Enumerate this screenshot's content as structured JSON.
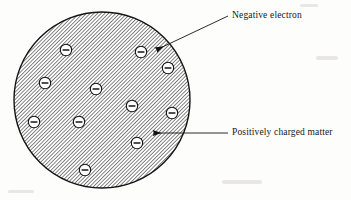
{
  "diagram": {
    "background_color": "#fdfdfc",
    "sphere": {
      "name": "positively-charged-matter-sphere",
      "center_x": 102,
      "center_y": 100,
      "radius": 88,
      "fill_pattern": "diagonal-hatch",
      "hatch_angle_deg": 45,
      "hatch_color": "#3a3a3a",
      "hatch_spacing_px": 2,
      "outline_color": "#1a1a1a",
      "outline_width": 1.4
    },
    "electrons": {
      "symbol": "−",
      "count": 11,
      "radius": 5.6,
      "fill_color": "#ffffff",
      "outline_color": "#141414",
      "sign_color": "#141414",
      "positions": [
        {
          "id": "electron-1",
          "x": 66,
          "y": 50
        },
        {
          "id": "electron-2",
          "x": 141,
          "y": 52
        },
        {
          "id": "electron-3",
          "x": 168,
          "y": 68
        },
        {
          "id": "electron-4",
          "x": 45,
          "y": 83
        },
        {
          "id": "electron-5",
          "x": 96,
          "y": 89
        },
        {
          "id": "electron-6",
          "x": 132,
          "y": 106
        },
        {
          "id": "electron-7",
          "x": 172,
          "y": 113
        },
        {
          "id": "electron-8",
          "x": 34,
          "y": 122
        },
        {
          "id": "electron-9",
          "x": 79,
          "y": 122
        },
        {
          "id": "electron-10",
          "x": 137,
          "y": 143
        },
        {
          "id": "electron-11",
          "x": 85,
          "y": 170
        }
      ]
    },
    "annotations": [
      {
        "id": "negative-electron",
        "label": "Negative electron",
        "text_x": 232,
        "text_y": 11,
        "leader": {
          "x1": 228,
          "y1": 17,
          "x2": 160,
          "y2": 48
        },
        "arrow_tip": {
          "x": 152,
          "y": 52
        },
        "arrow_angle_deg": 204,
        "color": "#171717"
      },
      {
        "id": "positively-charged-matter",
        "label": "Positively charged matter",
        "text_x": 232,
        "text_y": 128,
        "leader": {
          "x1": 228,
          "y1": 133,
          "x2": 163,
          "y2": 133
        },
        "arrow_tip": {
          "x": 150,
          "y": 133
        },
        "arrow_angle_deg": 180,
        "color": "#171717"
      }
    ]
  }
}
